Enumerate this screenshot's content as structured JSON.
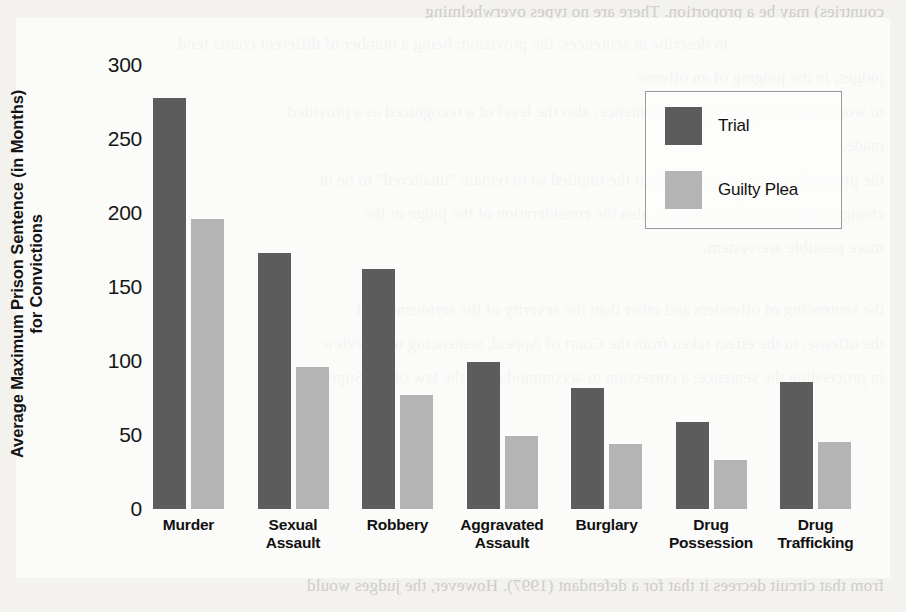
{
  "chart_data": {
    "type": "bar",
    "title": "",
    "xlabel": "",
    "ylabel_line1": "Average Maximum Prison Sentence (in Months)",
    "ylabel_line2": "for Convictions",
    "categories": [
      {
        "line1": "Murder",
        "line2": ""
      },
      {
        "line1": "Sexual",
        "line2": "Assault"
      },
      {
        "line1": "Robbery",
        "line2": ""
      },
      {
        "line1": "Aggravated",
        "line2": "Assault"
      },
      {
        "line1": "Burglary",
        "line2": ""
      },
      {
        "line1": "Drug",
        "line2": "Possession"
      },
      {
        "line1": "Drug",
        "line2": "Trafficking"
      }
    ],
    "series": [
      {
        "name": "Trial",
        "color": "#5c5c5c",
        "values": [
          278,
          173,
          162,
          99,
          82,
          59,
          86
        ]
      },
      {
        "name": "Guilty Plea",
        "color": "#b4b4b4",
        "values": [
          196,
          96,
          77,
          49,
          44,
          33,
          45
        ]
      }
    ],
    "yticks": [
      0,
      50,
      100,
      150,
      200,
      250,
      300
    ],
    "ylim": [
      0,
      300
    ],
    "grid": false,
    "legend_position": "upper-right"
  },
  "legend": {
    "entries": [
      {
        "label": "Trial",
        "color": "#5c5c5c"
      },
      {
        "label": "Guilty Plea",
        "color": "#b4b4b4"
      }
    ]
  },
  "page_bleed": {
    "top_line": "countries) may be a proportion. There are no types overwhelming",
    "lines": [
      "to describe in sentences, the provision: being a number of different courts tend",
      "judges, in the judging of an offense",
      "to work out that a guilty plea in sentence, also the level of a recognized as a provided",
      "made.",
      "the proceedings, presumption about the implied so to remain \"unaltered\" to be in",
      "change in judges and sentencing, also the consideration of the judge or the",
      "more possible are/system."
    ],
    "mid_lines": [
      "the sentencing of offenders and other than the severity of the seriousness of",
      "the offense, in the effect taken from the Court of Appeal, sentencing up a review",
      "in proceeding the sentence; a correction to accommodate in the law of the Supreme"
    ],
    "bottom_line": "from that circuit decrees it that for a defendant (1997). However, the judges would"
  }
}
